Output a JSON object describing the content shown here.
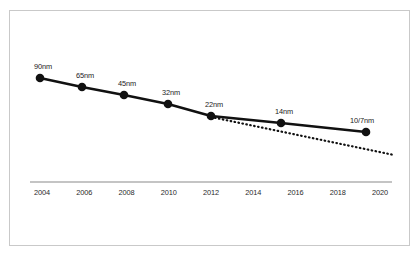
{
  "chart_data": {
    "type": "line",
    "title": "",
    "subtitle": "",
    "xlabel": "",
    "ylabel": "",
    "xlim": [
      2003,
      2021
    ],
    "ylim": [
      0,
      100
    ],
    "grid": false,
    "legend": "none",
    "x_tick_labels": [
      "2004",
      "2006",
      "2008",
      "2010",
      "2012",
      "2014",
      "2016",
      "2018",
      "2020"
    ],
    "x_ticks": [
      2004,
      2006,
      2008,
      2010,
      2012,
      2014,
      2016,
      2018,
      2020
    ],
    "series": [
      {
        "name": "Process node",
        "style": "solid",
        "marker": "circle",
        "color": "#111111",
        "points": [
          {
            "x": 2004,
            "label": "90nm",
            "value": 90,
            "px": 40,
            "py": 78
          },
          {
            "x": 2006,
            "label": "65nm",
            "value": 65,
            "px": 82,
            "py": 87
          },
          {
            "x": 2008,
            "label": "45nm",
            "value": 45,
            "px": 124,
            "py": 95
          },
          {
            "x": 2010,
            "label": "32nm",
            "value": 32,
            "px": 168,
            "py": 104
          },
          {
            "x": 2012,
            "label": "22nm",
            "value": 22,
            "px": 211,
            "py": 116
          },
          {
            "x": 2015.3,
            "label": "14nm",
            "value": 14,
            "px": 281,
            "py": 123
          },
          {
            "x": 2019.4,
            "label": "10/7nm",
            "value": 10,
            "px": 366,
            "py": 132
          }
        ]
      },
      {
        "name": "Projected trend",
        "style": "dotted",
        "marker": "none",
        "color": "#111111",
        "points": [
          {
            "x": 2012,
            "px": 211,
            "py": 117
          },
          {
            "x": 2020.4,
            "px": 394,
            "py": 155
          }
        ]
      }
    ],
    "axis": {
      "x_axis_line_color": "#8a8a8a",
      "x_axis_y_px": 182,
      "x_axis_start_px": 30,
      "x_axis_end_px": 392
    },
    "colors": {
      "line": "#111111",
      "marker": "#111111",
      "axis": "#8a8a8a",
      "frame": "#c9c9c9",
      "background": "#ffffff",
      "label_text": "#1a1a1a"
    }
  }
}
